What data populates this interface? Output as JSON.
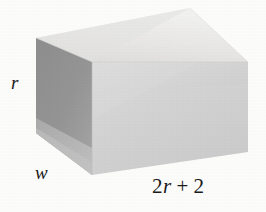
{
  "figure": {
    "kind": "rectangular-prism",
    "caption": "",
    "background_color": "#fdfdfc",
    "labels": {
      "height": {
        "text": "r",
        "style": "italic",
        "position": "left-edge"
      },
      "depth": {
        "text": "w",
        "style": "italic",
        "position": "bottom-left-edge"
      },
      "width": {
        "text_full": "2r + 2",
        "coefficient": "2",
        "variable": "r",
        "operator": "+",
        "constant": "2",
        "position": "bottom-front-edge"
      }
    },
    "faces": {
      "top": {
        "name": "top-face",
        "color": "#e9e9e7",
        "color_light": "#f1f1ef",
        "color_dark": "#dedede",
        "points": "36,38 190,8 248,62 92,62"
      },
      "left": {
        "name": "left-face",
        "color": "#949494",
        "color_light": "#b4b4b4",
        "color_dark": "#8a8a8a",
        "points": "36,38 92,62 92,175 36,133"
      },
      "front": {
        "name": "front-face",
        "color": "#d3d3d3",
        "color_light": "#dcdcdc",
        "color_dark": "#c6c6c6",
        "points": "92,62 248,62 248,152 92,175"
      }
    },
    "shading": {
      "left_lower_wedge_color": "#b9b9b9",
      "front_upper_band_color": "#dddddd",
      "top_left_wedge_color": "#dcdcdc"
    }
  }
}
